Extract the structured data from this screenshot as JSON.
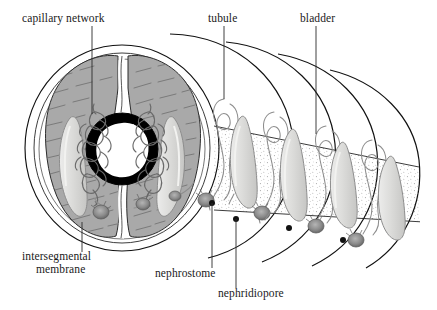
{
  "figure": {
    "view": "cut-away cross-section with successive body segments",
    "background_color": "#ffffff",
    "ink_color": "#111111"
  },
  "labels": [
    {
      "id": "capillary-network",
      "text": "capillary network",
      "text_x": 22,
      "text_y": 22,
      "anchor": "start",
      "leader": "M 92,26 L 92,114",
      "points_to": "coiled blood capillaries surrounding the nephridium in the left body lobe"
    },
    {
      "id": "tubule",
      "text": "tubule",
      "text_x": 208,
      "text_y": 22,
      "anchor": "start",
      "leader": "M 224,26 L 224,99",
      "points_to": "looped nephridial tubule of the second exposed segment"
    },
    {
      "id": "bladder",
      "text": "bladder",
      "text_x": 300,
      "text_y": 22,
      "anchor": "start",
      "leader": "M 316,26 L 316,134",
      "points_to": "enlarged sac-like bladder of the nephridium"
    },
    {
      "id": "intersegmental-membrane",
      "text": "intersegmental",
      "text_x": 22,
      "text_y": 260,
      "anchor": "start",
      "leader": "M 82,222 L 82,252",
      "points_to": "septum dividing adjacent body segments"
    },
    {
      "id": "intersegmental-membrane-line2",
      "text": "membrane",
      "text_x": 36,
      "text_y": 273,
      "anchor": "start",
      "leader": "",
      "points_to": ""
    },
    {
      "id": "nephrostome",
      "text": "nephrostome",
      "text_x": 155,
      "text_y": 277,
      "anchor": "start",
      "leader": "M 212,203 L 212,268",
      "points_to": "ciliated funnel opening of the nephridium into the coelom"
    },
    {
      "id": "nephridiopore",
      "text": "nephridiopore",
      "text_x": 218,
      "text_y": 297,
      "anchor": "start",
      "leader": "M 236,219 L 236,288",
      "points_to": "external excretory pore on the body wall"
    }
  ],
  "anatomy": {
    "cross_section": {
      "name": "body cross-section",
      "body_wall_color": "#ffffff",
      "lobe_fill": "#a9a9a9",
      "lobe_stroke": "#2d2d2d",
      "gut_ring_color": "#000000",
      "gut_lumen_color": "#ffffff",
      "center_x": 122,
      "center_y": 148,
      "radius_x": 97,
      "radius_y": 103
    },
    "segments": [
      {
        "index": 1,
        "arc_label": "segment-arc-1"
      },
      {
        "index": 2,
        "arc_label": "segment-arc-2"
      },
      {
        "index": 3,
        "arc_label": "segment-arc-3"
      },
      {
        "index": 4,
        "arc_label": "segment-arc-4"
      }
    ],
    "nephridia_units": [
      {
        "index": 1,
        "bladder_x": 243,
        "bladder_y": 150,
        "pore_x": 212,
        "pore_y": 203,
        "nephrostome_x": 206,
        "nephrostome_y": 200
      },
      {
        "index": 2,
        "bladder_x": 292,
        "bladder_y": 163,
        "pore_x": 236,
        "pore_y": 219,
        "nephrostome_x": 262,
        "nephrostome_y": 213
      },
      {
        "index": 3,
        "bladder_x": 341,
        "bladder_y": 176,
        "pore_x": 289,
        "pore_y": 228,
        "nephrostome_x": 316,
        "nephrostome_y": 226
      },
      {
        "index": 4,
        "bladder_x": 372,
        "bladder_y": 186,
        "pore_x": 343,
        "pore_y": 240,
        "nephrostome_x": 356,
        "nephrostome_y": 240
      }
    ],
    "colors": {
      "organ_fill": "#d8d8d6",
      "organ_stroke": "#8d8d8d",
      "nephrostome_fill": "#8a8a8a",
      "pore_dot": "#111111",
      "stipple": "#9a9a9a"
    }
  }
}
